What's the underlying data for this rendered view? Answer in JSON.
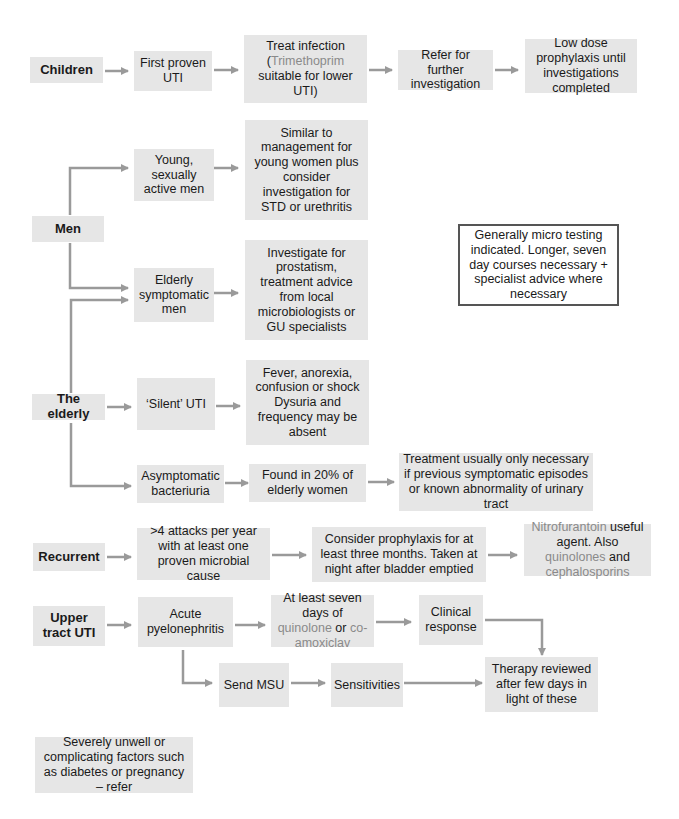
{
  "colors": {
    "box_fill": "#e6e6e6",
    "arrow": "#9a9a9a",
    "drug_text": "#8a8a8a",
    "text": "#1a1a1a"
  },
  "children": {
    "label": "Children",
    "first_proven": "First proven UTI",
    "treat_1": "Treat infection",
    "treat_2a": "(",
    "treat_drug": "Trimethoprim",
    "treat_2b": "suitable for lower UTI)",
    "refer": "Refer for further investigation",
    "prophylaxis": "Low dose prophylaxis until investigations completed"
  },
  "men": {
    "label": "Men",
    "young": "Young, sexually active men",
    "young_advice": "Similar to management for young women plus consider investigation for STD or urethritis",
    "elderly": "Elderly symptomatic men",
    "elderly_advice": "Investigate for prostatism, treatment advice from local microbiologists or GU specialists"
  },
  "note": "Generally micro testing indicated. Longer, seven day courses necessary + specialist advice where necessary",
  "elderly": {
    "label": "The elderly",
    "silent": "‘Silent’ UTI",
    "silent_signs": "Fever, anorexia, confusion or shock Dysuria and frequency may be absent",
    "asymptomatic": "Asymptomatic bacteriuria",
    "found": "Found in 20% of elderly women",
    "treatment": "Treatment usually only necessary if previous symptomatic episodes or known abnormality of urinary tract"
  },
  "recurrent": {
    "label": "Recurrent",
    "attacks": ">4 attacks per year with at least one proven microbial cause",
    "prophylaxis": "Consider prophylaxis for at least three months. Taken at night after bladder emptied",
    "agent_drug1": "Nitrofurantoin",
    "agent_text1": " useful agent. Also ",
    "agent_drug2": "quinolones",
    "agent_text2": " and ",
    "agent_drug3": "cephalosporins"
  },
  "upper": {
    "label": "Upper tract UTI",
    "acute": "Acute pyelonephritis",
    "days_text1": "At least seven days of ",
    "days_drug1": "quinolone",
    "days_text2": " or ",
    "days_drug2": "co-amoxiclav",
    "clinical": "Clinical response",
    "msu": "Send MSU",
    "sensitivities": "Sensitivities",
    "therapy": "Therapy reviewed after few days in light of these"
  },
  "severe": "Severely unwell or complicating factors such as diabetes or pregnancy – refer"
}
